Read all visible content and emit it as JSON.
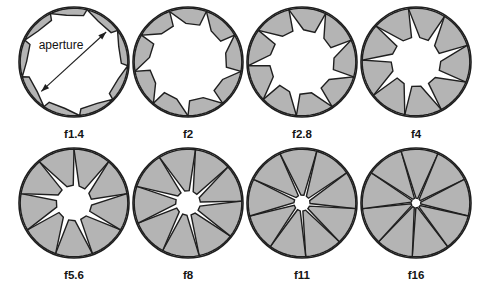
{
  "figure": {
    "background_color": "#ffffff",
    "blade_fill_color": "#b4b4b4",
    "outline_color": "#1f1f1f",
    "opening_color": "#ffffff",
    "blade_count": 9,
    "annotation": {
      "label": "aperture",
      "arrow_style": "double-headed",
      "arrow_from": "lower-left rim of opening",
      "arrow_to": "upper-right rim of opening",
      "describes": "diameter of the clear opening"
    },
    "rows": 2,
    "columns": 4,
    "stops": [
      {
        "id": "f1-4",
        "label": "f1.4",
        "row": 0,
        "col": 0,
        "cx": 74,
        "cy": 62,
        "r": 55,
        "opening_ratio": 0.88,
        "rotation_deg": 4,
        "annotated": true
      },
      {
        "id": "f2",
        "label": "f2",
        "row": 0,
        "col": 1,
        "cx": 188,
        "cy": 62,
        "r": 55,
        "opening_ratio": 0.72,
        "rotation_deg": 10,
        "annotated": false
      },
      {
        "id": "f2-8",
        "label": "f2.8",
        "row": 0,
        "col": 2,
        "cx": 302,
        "cy": 62,
        "r": 55,
        "opening_ratio": 0.6,
        "rotation_deg": 16,
        "annotated": false
      },
      {
        "id": "f4",
        "label": "f4",
        "row": 0,
        "col": 3,
        "cx": 416,
        "cy": 62,
        "r": 55,
        "opening_ratio": 0.46,
        "rotation_deg": 22,
        "annotated": false
      },
      {
        "id": "f5-6",
        "label": "f5.6",
        "row": 1,
        "col": 0,
        "cx": 74,
        "cy": 203,
        "r": 55,
        "opening_ratio": 0.33,
        "rotation_deg": 30,
        "annotated": false
      },
      {
        "id": "f8",
        "label": "f8",
        "row": 1,
        "col": 1,
        "cx": 188,
        "cy": 203,
        "r": 55,
        "opening_ratio": 0.23,
        "rotation_deg": 38,
        "annotated": false
      },
      {
        "id": "f11",
        "label": "f11",
        "row": 1,
        "col": 2,
        "cx": 302,
        "cy": 203,
        "r": 55,
        "opening_ratio": 0.15,
        "rotation_deg": 46,
        "annotated": false
      },
      {
        "id": "f16",
        "label": "f16",
        "row": 1,
        "col": 3,
        "cx": 416,
        "cy": 203,
        "r": 55,
        "opening_ratio": 0.09,
        "rotation_deg": 54,
        "annotated": false
      }
    ],
    "caption_offset_y": 76
  }
}
